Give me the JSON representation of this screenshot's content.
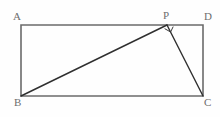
{
  "figure": {
    "canvas": {
      "width": 220,
      "height": 117,
      "background": "#fefefe"
    },
    "styles": {
      "rectangle_stroke": "#6b6b6b",
      "rectangle_stroke_width": 1.6,
      "diagonal_stroke": "#2f2f2f",
      "diagonal_stroke_width": 1.4,
      "right_angle_stroke": "#3a3a3a",
      "right_angle_stroke_width": 1.0,
      "label_color": "#6e6e6e",
      "label_font_size": 11
    },
    "points": {
      "A": {
        "label": "A",
        "x": 21,
        "y": 25
      },
      "D": {
        "label": "D",
        "x": 203,
        "y": 25
      },
      "C": {
        "label": "C",
        "x": 203,
        "y": 96
      },
      "B": {
        "label": "B",
        "x": 21,
        "y": 96
      },
      "P": {
        "label": "P",
        "x": 167,
        "y": 25
      }
    },
    "rectangle_path": "M 21 25 L 203 25 L 203 96 L 21 96 Z",
    "segments": [
      {
        "name": "BP",
        "from": "B",
        "to": "P",
        "d": "M 21 96 L 167 25"
      },
      {
        "name": "PC",
        "from": "P",
        "to": "C",
        "d": "M 167 25 L 203 96"
      }
    ],
    "right_angle_marker": {
      "at": "P",
      "angle": "BPC",
      "measure": "90",
      "d": "M 164.6 28.6 L 170.6 32.0 L 173.2 26.6"
    },
    "labels": {
      "A": "A",
      "D": "D",
      "P": "P",
      "B": "B",
      "C": "C"
    }
  }
}
